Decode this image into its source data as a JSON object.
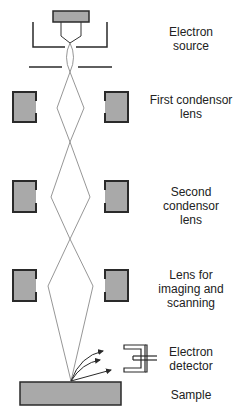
{
  "diagram": {
    "colors": {
      "lens_fill": "#a9a9a9",
      "lens_border": "#2a2a2a",
      "beam": "#8a8a8a",
      "line": "#2a2a2a",
      "text": "#222222"
    },
    "labels": {
      "electron_source": {
        "line1": "Electron",
        "line2": "source"
      },
      "first_condensor": {
        "line1": "First condensor",
        "line2": "lens"
      },
      "second_condensor": {
        "line1": "Second condensor",
        "line2": "lens"
      },
      "imaging_lens": {
        "line1": "Lens for",
        "line2": "imaging and",
        "line3": "scanning"
      },
      "electron_detector": {
        "line1": "Electron",
        "line2": "detector"
      },
      "sample": {
        "line1": "Sample"
      }
    }
  }
}
